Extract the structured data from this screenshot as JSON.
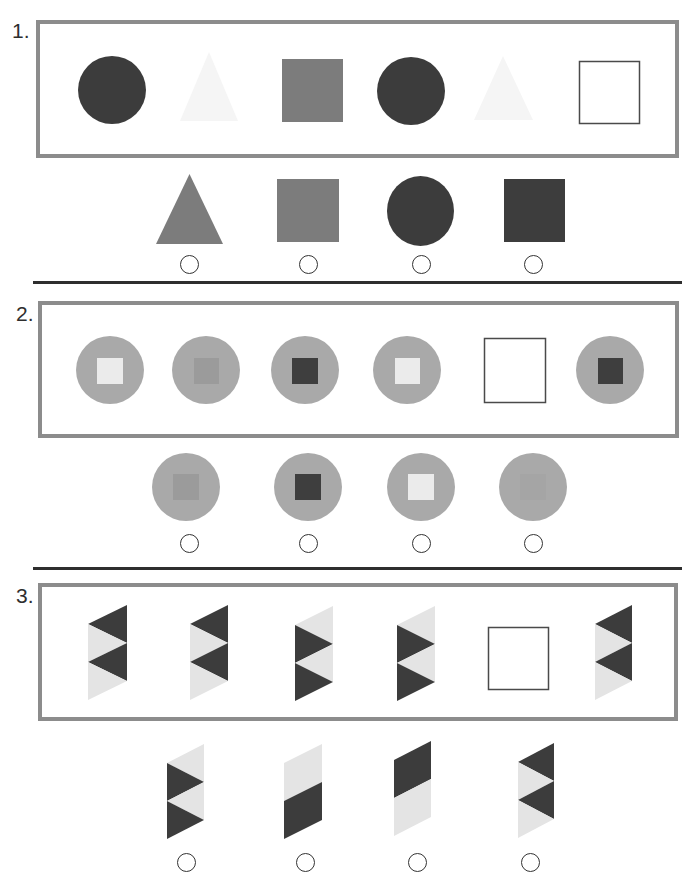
{
  "problems": [
    {
      "number": "1.",
      "sequence": [
        {
          "shape": "circle",
          "fill": "#3c3c3c"
        },
        {
          "shape": "triangle",
          "fill": "#f5f5f5"
        },
        {
          "shape": "square",
          "fill": "#7c7c7c"
        },
        {
          "shape": "circle",
          "fill": "#3c3c3c"
        },
        {
          "shape": "triangle",
          "fill": "#f5f5f5"
        },
        {
          "shape": "missing-blank-square",
          "stroke": "#4a4a4a"
        }
      ],
      "options": [
        {
          "shape": "triangle",
          "fill": "#7c7c7c",
          "selected": "false"
        },
        {
          "shape": "square",
          "fill": "#7c7c7c",
          "selected": "false"
        },
        {
          "shape": "circle",
          "fill": "#3c3c3c",
          "selected": "false"
        },
        {
          "shape": "square",
          "fill": "#3d3d3d",
          "selected": "false"
        }
      ]
    },
    {
      "number": "2.",
      "sequence": [
        {
          "shape": "circle-with-square",
          "circle_fill": "#a9a9a9",
          "square_fill": "#ebebeb"
        },
        {
          "shape": "circle-with-square",
          "circle_fill": "#a9a9a9",
          "square_fill": "#9b9b9b"
        },
        {
          "shape": "circle-with-square",
          "circle_fill": "#a9a9a9",
          "square_fill": "#3e3e3e"
        },
        {
          "shape": "circle-with-square",
          "circle_fill": "#a9a9a9",
          "square_fill": "#ebebeb"
        },
        {
          "shape": "missing-blank-square",
          "stroke": "#4a4a4a"
        },
        {
          "shape": "circle-with-square",
          "circle_fill": "#a9a9a9",
          "square_fill": "#3e3e3e"
        }
      ],
      "options": [
        {
          "shape": "circle-with-square",
          "circle_fill": "#a9a9a9",
          "square_fill": "#9b9b9b",
          "selected": "false"
        },
        {
          "shape": "circle-with-square",
          "circle_fill": "#a9a9a9",
          "square_fill": "#3e3e3e",
          "selected": "false"
        },
        {
          "shape": "circle-with-square",
          "circle_fill": "#a9a9a9",
          "square_fill": "#ebebeb",
          "selected": "false"
        },
        {
          "shape": "circle-with-square",
          "circle_fill": "#a9a9a9",
          "square_fill": "#a5a5a5",
          "selected": "false"
        }
      ]
    },
    {
      "number": "3.",
      "sequence": [
        {
          "shape": "parallelogram-4-triangles",
          "pieces": [
            "#3c3c3c",
            "#e4e4e4",
            "#3c3c3c",
            "#e4e4e4"
          ]
        },
        {
          "shape": "parallelogram-4-triangles",
          "pieces": [
            "#3c3c3c",
            "#e4e4e4",
            "#3c3c3c",
            "#e4e4e4"
          ]
        },
        {
          "shape": "parallelogram-4-triangles",
          "pieces": [
            "#e4e4e4",
            "#3c3c3c",
            "#e4e4e4",
            "#3c3c3c"
          ]
        },
        {
          "shape": "parallelogram-4-triangles",
          "pieces": [
            "#e4e4e4",
            "#3c3c3c",
            "#e4e4e4",
            "#3c3c3c"
          ]
        },
        {
          "shape": "missing-blank-square",
          "stroke": "#4a4a4a"
        },
        {
          "shape": "parallelogram-4-triangles",
          "pieces": [
            "#3c3c3c",
            "#e4e4e4",
            "#3c3c3c",
            "#e4e4e4"
          ]
        }
      ],
      "options": [
        {
          "shape": "parallelogram-4-triangles",
          "pieces": [
            "#e4e4e4",
            "#3c3c3c",
            "#e4e4e4",
            "#3c3c3c"
          ],
          "selected": "false"
        },
        {
          "shape": "parallelogram-2-halves",
          "pieces": [
            "#e4e4e4",
            "#3c3c3c"
          ],
          "selected": "false"
        },
        {
          "shape": "parallelogram-2-halves",
          "pieces": [
            "#3c3c3c",
            "#e4e4e4"
          ],
          "selected": "false"
        },
        {
          "shape": "parallelogram-4-triangles",
          "pieces": [
            "#3c3c3c",
            "#e4e4e4",
            "#3c3c3c",
            "#e4e4e4"
          ],
          "selected": "false"
        }
      ]
    }
  ]
}
